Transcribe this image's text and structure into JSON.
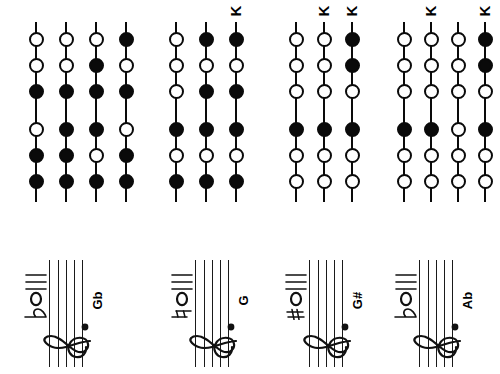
{
  "chart": {
    "hole_states": {
      "open": "open",
      "closed": "closed"
    },
    "key_marker_label": "K",
    "groups": [
      {
        "id": "group-gb",
        "note_label": "Gb",
        "accidental": "flat",
        "left": 8,
        "width": 135,
        "col_spacing": 30,
        "col_offset": 16,
        "columns": 4,
        "key_markers": [],
        "rows": [
          {
            "row": "top",
            "columns": [
              [
                "open",
                "open",
                "closed"
              ],
              [
                "open",
                "open",
                "closed"
              ],
              [
                "open",
                "closed",
                "closed"
              ],
              [
                "closed",
                "open",
                "closed"
              ]
            ]
          },
          {
            "row": "bottom",
            "columns": [
              [
                "open",
                "closed",
                "closed"
              ],
              [
                "closed",
                "closed",
                "closed"
              ],
              [
                "closed",
                "open",
                "closed"
              ],
              [
                "open",
                "closed",
                "closed"
              ]
            ]
          }
        ]
      },
      {
        "id": "group-g",
        "note_label": "G",
        "accidental": "natural",
        "left": 148,
        "width": 105,
        "col_spacing": 30,
        "col_offset": 16,
        "columns": 3,
        "key_markers": [
          2
        ],
        "rows": [
          {
            "row": "top",
            "columns": [
              [
                "open",
                "open",
                "open"
              ],
              [
                "closed",
                "open",
                "closed"
              ],
              [
                "closed",
                "open",
                "closed"
              ]
            ]
          },
          {
            "row": "bottom",
            "columns": [
              [
                "closed",
                "open",
                "closed"
              ],
              [
                "closed",
                "open",
                "closed"
              ],
              [
                "closed",
                "open",
                "closed"
              ]
            ]
          }
        ]
      },
      {
        "id": "group-gsharp",
        "note_label": "G#",
        "accidental": "sharp",
        "left": 268,
        "width": 105,
        "col_spacing": 28,
        "col_offset": 16,
        "columns": 3,
        "key_markers": [
          1,
          2
        ],
        "rows": [
          {
            "row": "top",
            "columns": [
              [
                "open",
                "open",
                "open"
              ],
              [
                "open",
                "open",
                "open"
              ],
              [
                "closed",
                "closed",
                "open"
              ]
            ]
          },
          {
            "row": "bottom",
            "columns": [
              [
                "closed",
                "open",
                "open"
              ],
              [
                "closed",
                "open",
                "open"
              ],
              [
                "closed",
                "open",
                "open"
              ]
            ]
          }
        ]
      },
      {
        "id": "group-ab",
        "note_label": "Ab",
        "accidental": "flat",
        "left": 378,
        "width": 118,
        "col_spacing": 27,
        "col_offset": 14,
        "columns": 4,
        "key_markers": [
          1,
          3
        ],
        "rows": [
          {
            "row": "top",
            "columns": [
              [
                "open",
                "open",
                "open"
              ],
              [
                "open",
                "open",
                "open"
              ],
              [
                "open",
                "open",
                "open"
              ],
              [
                "closed",
                "closed",
                "open"
              ]
            ]
          },
          {
            "row": "bottom",
            "columns": [
              [
                "closed",
                "open",
                "open"
              ],
              [
                "closed",
                "open",
                "open"
              ],
              [
                "open",
                "open",
                "open"
              ],
              [
                "closed",
                "open",
                "open"
              ]
            ]
          }
        ]
      }
    ]
  },
  "notation": {
    "staff_line_count": 5,
    "clef": "treble-clef",
    "ledger_line_count": 3,
    "staves": [
      {
        "id": "staff-gb",
        "label": "Gb",
        "accidental": "flat",
        "left": 6
      },
      {
        "id": "staff-g",
        "label": "G",
        "accidental": "natural",
        "left": 152
      },
      {
        "id": "staff-gsharp",
        "label": "G#",
        "accidental": "sharp",
        "left": 266
      },
      {
        "id": "staff-ab",
        "label": "Ab",
        "accidental": "flat",
        "left": 376
      }
    ]
  },
  "colors": {
    "ink": "#0a0a0a",
    "staff": "#1a1a1a",
    "background": "#ffffff"
  }
}
